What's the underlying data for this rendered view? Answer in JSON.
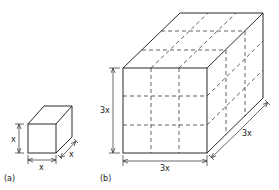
{
  "figure": {
    "panel_a": {
      "caption": "(a)",
      "height_label": "x",
      "width_label": "x",
      "depth_label": "x"
    },
    "panel_b": {
      "caption": "(b)",
      "height_label": "3x",
      "width_label": "3x",
      "depth_label": "3x",
      "subdivisions": 3
    }
  },
  "colors": {
    "line": "#2a2a2a",
    "background": "#ffffff"
  }
}
